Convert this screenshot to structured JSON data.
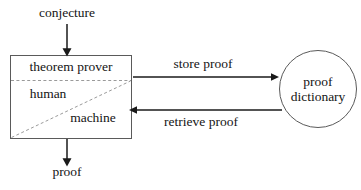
{
  "diagram": {
    "type": "flow-diagram",
    "background_color": "#ffffff",
    "stroke_color": "#1a1a1a",
    "dash_color": "#8a8a8a"
  },
  "labels": {
    "conjecture": "conjecture",
    "theorem_prover": "theorem prover",
    "human": "human",
    "machine": "machine",
    "store_proof": "store proof",
    "retrieve_proof": "retrieve proof",
    "proof_output": "proof",
    "dictionary_line1": "proof",
    "dictionary_line2": "dictionary"
  },
  "nodes": {
    "prover_box": {
      "label": "theorem prover",
      "shape": "rectangle",
      "x": 10,
      "y": 55,
      "width": 122,
      "height": 84,
      "sections": [
        "theorem prover",
        "human",
        "machine"
      ]
    },
    "dictionary_circle": {
      "label": "proof dictionary",
      "shape": "circle",
      "cx": 318,
      "cy": 89,
      "r": 38.5
    }
  },
  "edges": [
    {
      "name": "conjecture-input",
      "label": "conjecture",
      "from": "conjecture",
      "to": "prover_box",
      "direction": "down",
      "style": "solid"
    },
    {
      "name": "store-proof",
      "label": "store proof",
      "from": "prover_box",
      "to": "dictionary_circle",
      "direction": "right",
      "style": "solid"
    },
    {
      "name": "retrieve-proof",
      "label": "retrieve proof",
      "from": "dictionary_circle",
      "to": "prover_box",
      "direction": "left",
      "style": "solid"
    },
    {
      "name": "proof-output",
      "label": "proof",
      "from": "prover_box",
      "to": "proof",
      "direction": "down",
      "style": "solid"
    }
  ],
  "dividers": [
    {
      "name": "horizontal-divider",
      "style": "dashed",
      "x1": 10,
      "y1": 80,
      "x2": 132,
      "y2": 80
    },
    {
      "name": "diagonal-divider",
      "style": "dashed",
      "x1": 11,
      "y1": 138,
      "x2": 131,
      "y2": 81
    }
  ]
}
